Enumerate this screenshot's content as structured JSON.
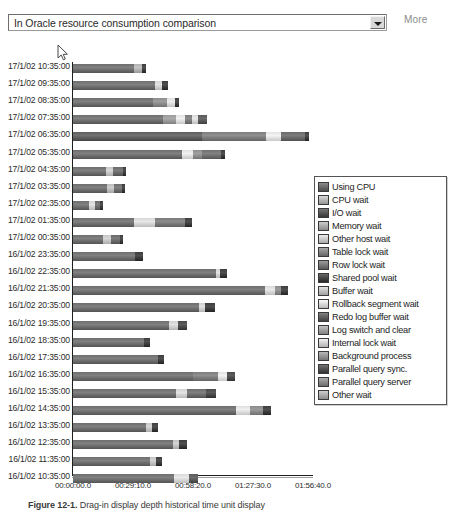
{
  "toolbar": {
    "selected_option": "In Oracle resource consumption comparison",
    "dropdown_arrow_icon": "chevron-down-icon",
    "more_label": "More"
  },
  "caption": {
    "figure_label": "Figure 12-1.",
    "figure_text": "Drag-in display depth historical time unit display"
  },
  "chart_data": {
    "type": "bar",
    "orientation": "horizontal",
    "stacked": true,
    "title": "In Oracle resource consumption comparison",
    "xlabel": "",
    "ylabel": "",
    "grid": false,
    "legend_position": "right-inset",
    "xlim": [
      0,
      7000
    ],
    "xtick_labels": [
      "00:00:00.0",
      "00:29:10.0",
      "00:58:20.0",
      "01:27:30.0",
      "01:56:40.0"
    ],
    "xtick_values": [
      0,
      1750,
      3500,
      5250,
      7000
    ],
    "categories": [
      "17/1/02 10:35:00",
      "17/1/02 09:35:00",
      "17/1/02 08:35:00",
      "17/1/02 07:35:00",
      "17/1/02 06:35:00",
      "17/1/02 05:35:00",
      "17/1/02 04:35:00",
      "17/1/02 03:35:00",
      "17/1/02 02:35:00",
      "17/1/02 01:35:00",
      "17/1/02 00:35:00",
      "16/1/02 23:35:00",
      "16/1/02 22:35:00",
      "16/1/02 21:35:00",
      "16/1/02 20:35:00",
      "16/1/02 19:35:00",
      "16/1/02 18:35:00",
      "16/1/02 17:35:00",
      "16/1/02 16:35:00",
      "16/1/02 15:35:00",
      "16/1/02 14:35:00",
      "16/1/02 13:35:00",
      "16/1/02 12:35:00",
      "16/1/02 11:35:00",
      "16/1/02 10:35:00"
    ],
    "legend_entries": [
      {
        "label": "Using CPU",
        "color": "#6e6e6e"
      },
      {
        "label": "CPU wait",
        "color": "#b9b9b9"
      },
      {
        "label": "I/O wait",
        "color": "#595959"
      },
      {
        "label": "Memory wait",
        "color": "#aeaeae"
      },
      {
        "label": "Other host wait",
        "color": "#cfcfcf"
      },
      {
        "label": "Table lock wait",
        "color": "#8a8a8a"
      },
      {
        "label": "Row lock wait",
        "color": "#7d7d7d"
      },
      {
        "label": "Shared pool wait",
        "color": "#4a4a4a"
      },
      {
        "label": "Buffer wait",
        "color": "#c4c4c4"
      },
      {
        "label": "Rollback segment wait",
        "color": "#dcdcdc"
      },
      {
        "label": "Redo log buffer wait",
        "color": "#646464"
      },
      {
        "label": "Log switch and clear",
        "color": "#a4a4a4"
      },
      {
        "label": "Internal lock wait",
        "color": "#d4d4d4"
      },
      {
        "label": "Background process",
        "color": "#9a9a9a"
      },
      {
        "label": "Parallel query sync.",
        "color": "#555555"
      },
      {
        "label": "Parallel query server",
        "color": "#8f8f8f"
      },
      {
        "label": "Other wait",
        "color": "#b0b0b0"
      }
    ],
    "bars": [
      {
        "category": "17/1/02 10:35:00",
        "total": 2130,
        "segments": [
          {
            "series": "Using CPU",
            "value": 1780,
            "color": "#6e6e6e"
          },
          {
            "series": "CPU wait",
            "value": 230,
            "color": "#b3b3b3"
          },
          {
            "series": "Other wait",
            "value": 120,
            "color": "#3d3d3d"
          }
        ]
      },
      {
        "category": "17/1/02 09:35:00",
        "total": 2770,
        "segments": [
          {
            "series": "Using CPU",
            "value": 2390,
            "color": "#6e6e6e"
          },
          {
            "series": "CPU wait",
            "value": 200,
            "color": "#d2d2d2"
          },
          {
            "series": "Other wait",
            "value": 180,
            "color": "#3d3d3d"
          }
        ]
      },
      {
        "category": "17/1/02 08:35:00",
        "total": 3100,
        "segments": [
          {
            "series": "Using CPU",
            "value": 2340,
            "color": "#6e6e6e"
          },
          {
            "series": "I/O wait",
            "value": 410,
            "color": "#8c8c8c"
          },
          {
            "series": "Buffer wait",
            "value": 230,
            "color": "#dcdcdc"
          },
          {
            "series": "Other wait",
            "value": 120,
            "color": "#3d3d3d"
          }
        ]
      },
      {
        "category": "17/1/02 07:35:00",
        "total": 3900,
        "segments": [
          {
            "series": "Using CPU",
            "value": 2620,
            "color": "#6e6e6e"
          },
          {
            "series": "I/O wait",
            "value": 380,
            "color": "#9a9a9a"
          },
          {
            "series": "Buffer wait",
            "value": 260,
            "color": "#e0e0e0"
          },
          {
            "series": "Table lock wait",
            "value": 200,
            "color": "#7a7a7a"
          },
          {
            "series": "Rollback segment wait",
            "value": 180,
            "color": "#d8d8d8"
          },
          {
            "series": "Other wait",
            "value": 260,
            "color": "#5a5a5a"
          }
        ]
      },
      {
        "category": "17/1/02 06:35:00",
        "total": 6880,
        "segments": [
          {
            "series": "Using CPU",
            "value": 3760,
            "color": "#5f5f5f"
          },
          {
            "series": "I/O wait",
            "value": 1870,
            "color": "#7d7d7d"
          },
          {
            "series": "Buffer wait",
            "value": 440,
            "color": "#e2e2e2"
          },
          {
            "series": "Table lock wait",
            "value": 700,
            "color": "#6a6a6a"
          },
          {
            "series": "Other wait",
            "value": 110,
            "color": "#3d3d3d"
          }
        ]
      },
      {
        "category": "17/1/02 05:35:00",
        "total": 4430,
        "segments": [
          {
            "series": "Using CPU",
            "value": 3180,
            "color": "#6e6e6e"
          },
          {
            "series": "Buffer wait",
            "value": 320,
            "color": "#e0e0e0"
          },
          {
            "series": "I/O wait",
            "value": 260,
            "color": "#8e8e8e"
          },
          {
            "series": "Table lock wait",
            "value": 560,
            "color": "#707070"
          },
          {
            "series": "Other wait",
            "value": 110,
            "color": "#3d3d3d"
          }
        ]
      },
      {
        "category": "17/1/02 04:35:00",
        "total": 1560,
        "segments": [
          {
            "series": "Using CPU",
            "value": 960,
            "color": "#6e6e6e"
          },
          {
            "series": "CPU wait",
            "value": 220,
            "color": "#c6c6c6"
          },
          {
            "series": "I/O wait",
            "value": 290,
            "color": "#6a6a6a"
          },
          {
            "series": "Other wait",
            "value": 90,
            "color": "#3d3d3d"
          }
        ]
      },
      {
        "category": "17/1/02 03:35:00",
        "total": 1530,
        "segments": [
          {
            "series": "Using CPU",
            "value": 980,
            "color": "#6e6e6e"
          },
          {
            "series": "CPU wait",
            "value": 230,
            "color": "#bdbdbd"
          },
          {
            "series": "I/O wait",
            "value": 230,
            "color": "#6e6e6e"
          },
          {
            "series": "Other wait",
            "value": 90,
            "color": "#3d3d3d"
          }
        ]
      },
      {
        "category": "17/1/02 02:35:00",
        "total": 880,
        "segments": [
          {
            "series": "Using CPU",
            "value": 470,
            "color": "#6e6e6e"
          },
          {
            "series": "CPU wait",
            "value": 170,
            "color": "#d2d2d2"
          },
          {
            "series": "I/O wait",
            "value": 150,
            "color": "#6a6a6a"
          },
          {
            "series": "Other wait",
            "value": 90,
            "color": "#3d3d3d"
          }
        ]
      },
      {
        "category": "17/1/02 01:35:00",
        "total": 3480,
        "segments": [
          {
            "series": "Using CPU",
            "value": 1780,
            "color": "#6e6e6e"
          },
          {
            "series": "Buffer wait",
            "value": 600,
            "color": "#d6d6d6"
          },
          {
            "series": "I/O wait",
            "value": 880,
            "color": "#7a7a7a"
          },
          {
            "series": "Other wait",
            "value": 220,
            "color": "#3d3d3d"
          }
        ]
      },
      {
        "category": "17/1/02 00:35:00",
        "total": 1470,
        "segments": [
          {
            "series": "Using CPU",
            "value": 880,
            "color": "#6e6e6e"
          },
          {
            "series": "CPU wait",
            "value": 220,
            "color": "#c6c6c6"
          },
          {
            "series": "I/O wait",
            "value": 280,
            "color": "#6a6a6a"
          },
          {
            "series": "Other wait",
            "value": 90,
            "color": "#3d3d3d"
          }
        ]
      },
      {
        "category": "16/1/02 23:35:00",
        "total": 2040,
        "segments": [
          {
            "series": "Using CPU",
            "value": 1810,
            "color": "#6e6e6e"
          },
          {
            "series": "Other wait",
            "value": 230,
            "color": "#3d3d3d"
          }
        ]
      },
      {
        "category": "16/1/02 22:35:00",
        "total": 4490,
        "segments": [
          {
            "series": "Using CPU",
            "value": 4160,
            "color": "#6e6e6e"
          },
          {
            "series": "Buffer wait",
            "value": 120,
            "color": "#d2d2d2"
          },
          {
            "series": "Other wait",
            "value": 210,
            "color": "#3d3d3d"
          }
        ]
      },
      {
        "category": "16/1/02 21:35:00",
        "total": 6270,
        "segments": [
          {
            "series": "Using CPU",
            "value": 5600,
            "color": "#6e6e6e"
          },
          {
            "series": "Buffer wait",
            "value": 300,
            "color": "#d8d8d8"
          },
          {
            "series": "I/O wait",
            "value": 160,
            "color": "#8a8a8a"
          },
          {
            "series": "Other wait",
            "value": 210,
            "color": "#3d3d3d"
          }
        ]
      },
      {
        "category": "16/1/02 20:35:00",
        "total": 4130,
        "segments": [
          {
            "series": "Using CPU",
            "value": 3670,
            "color": "#6e6e6e"
          },
          {
            "series": "Buffer wait",
            "value": 180,
            "color": "#cfcfcf"
          },
          {
            "series": "Other wait",
            "value": 280,
            "color": "#3d3d3d"
          }
        ]
      },
      {
        "category": "16/1/02 19:35:00",
        "total": 3330,
        "segments": [
          {
            "series": "Using CPU",
            "value": 2800,
            "color": "#6e6e6e"
          },
          {
            "series": "Buffer wait",
            "value": 250,
            "color": "#cfcfcf"
          },
          {
            "series": "Other wait",
            "value": 280,
            "color": "#4a4a4a"
          }
        ]
      },
      {
        "category": "16/1/02 18:35:00",
        "total": 2240,
        "segments": [
          {
            "series": "Using CPU",
            "value": 2060,
            "color": "#6e6e6e"
          },
          {
            "series": "Other wait",
            "value": 180,
            "color": "#3d3d3d"
          }
        ]
      },
      {
        "category": "16/1/02 17:35:00",
        "total": 2660,
        "segments": [
          {
            "series": "Using CPU",
            "value": 2480,
            "color": "#6e6e6e"
          },
          {
            "series": "Other wait",
            "value": 180,
            "color": "#3d3d3d"
          }
        ]
      },
      {
        "category": "16/1/02 16:35:00",
        "total": 4720,
        "segments": [
          {
            "series": "Using CPU",
            "value": 3500,
            "color": "#6e6e6e"
          },
          {
            "series": "I/O wait",
            "value": 740,
            "color": "#7d7d7d"
          },
          {
            "series": "Buffer wait",
            "value": 250,
            "color": "#e0e0e0"
          },
          {
            "series": "Other wait",
            "value": 230,
            "color": "#4a4a4a"
          }
        ]
      },
      {
        "category": "16/1/02 15:35:00",
        "total": 4180,
        "segments": [
          {
            "series": "Using CPU",
            "value": 3000,
            "color": "#6e6e6e"
          },
          {
            "series": "Buffer wait",
            "value": 320,
            "color": "#d2d2d2"
          },
          {
            "series": "I/O wait",
            "value": 570,
            "color": "#6e6e6e"
          },
          {
            "series": "Other wait",
            "value": 290,
            "color": "#4a4a4a"
          }
        ]
      },
      {
        "category": "16/1/02 14:35:00",
        "total": 5780,
        "segments": [
          {
            "series": "Using CPU",
            "value": 4740,
            "color": "#6e6e6e"
          },
          {
            "series": "Buffer wait",
            "value": 430,
            "color": "#dedede"
          },
          {
            "series": "I/O wait",
            "value": 380,
            "color": "#8a8a8a"
          },
          {
            "series": "Other wait",
            "value": 230,
            "color": "#3d3d3d"
          }
        ]
      },
      {
        "category": "16/1/02 13:35:00",
        "total": 2480,
        "segments": [
          {
            "series": "Using CPU",
            "value": 2120,
            "color": "#6e6e6e"
          },
          {
            "series": "Buffer wait",
            "value": 190,
            "color": "#c6c6c6"
          },
          {
            "series": "Other wait",
            "value": 170,
            "color": "#3d3d3d"
          }
        ]
      },
      {
        "category": "16/1/02 12:35:00",
        "total": 3330,
        "segments": [
          {
            "series": "Using CPU",
            "value": 2920,
            "color": "#6e6e6e"
          },
          {
            "series": "Buffer wait",
            "value": 180,
            "color": "#c2c2c2"
          },
          {
            "series": "Other wait",
            "value": 230,
            "color": "#3d3d3d"
          }
        ]
      },
      {
        "category": "16/1/02 11:35:00",
        "total": 2600,
        "segments": [
          {
            "series": "Using CPU",
            "value": 2240,
            "color": "#6e6e6e"
          },
          {
            "series": "Buffer wait",
            "value": 190,
            "color": "#c2c2c2"
          },
          {
            "series": "Other wait",
            "value": 170,
            "color": "#3d3d3d"
          }
        ]
      },
      {
        "category": "16/1/02 10:35:00",
        "total": 3650,
        "segments": [
          {
            "series": "Using CPU",
            "value": 2950,
            "color": "#6e6e6e"
          },
          {
            "series": "Buffer wait",
            "value": 420,
            "color": "#d8d8d8"
          },
          {
            "series": "Other wait",
            "value": 280,
            "color": "#5a5a5a"
          }
        ]
      }
    ]
  }
}
